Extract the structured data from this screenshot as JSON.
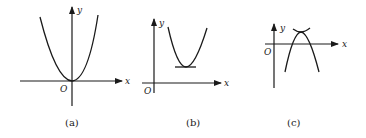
{
  "figure": {
    "panels": [
      {
        "id": "a",
        "caption": "(a)",
        "x_label": "x",
        "y_label": "y",
        "origin_label": "O",
        "description": "Upward-opening parabola with vertex at the origin"
      },
      {
        "id": "b",
        "caption": "(b)",
        "x_label": "x",
        "y_label": "y",
        "origin_label": "O",
        "description": "Upward-opening parabola with vertex in the first quadrant, horizontal tangent at vertex"
      },
      {
        "id": "c",
        "caption": "(c)",
        "x_label": "x",
        "y_label": "y",
        "origin_label": "O",
        "description": "Downward-opening parabola with vertex above the x-axis, crossing the x-axis twice"
      }
    ],
    "colors": {
      "ink": "#1a1a1a",
      "background": "#ffffff"
    }
  }
}
